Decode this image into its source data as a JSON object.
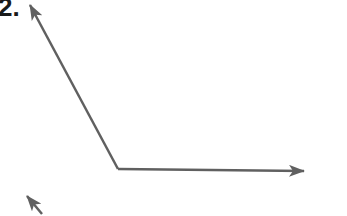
{
  "problem": {
    "number_label": "2."
  },
  "figure": {
    "stroke_color": "#606060",
    "angle": {
      "vertex": [
        118,
        169
      ],
      "ray_a_tip": [
        30,
        5
      ],
      "ray_b_tip": [
        304,
        171
      ]
    },
    "next_figure_arrow": {
      "tip": [
        27,
        196
      ],
      "tail": [
        40,
        212
      ]
    }
  }
}
